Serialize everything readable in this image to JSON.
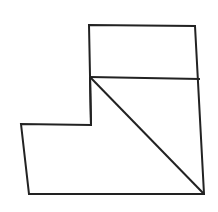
{
  "diagram": {
    "stroke_color": "#222222",
    "background": "#ffffff",
    "outline": "89,25 195,26 204,194 29,194 21,124 91,125",
    "segments": [
      {
        "name": "horizontal-divider",
        "x1": 90,
        "y1": 77,
        "x2": 200,
        "y2": 79
      },
      {
        "name": "diagonal",
        "x1": 90,
        "y1": 77,
        "x2": 204,
        "y2": 194
      },
      {
        "name": "inner-vertical",
        "x1": 90,
        "y1": 77,
        "x2": 91,
        "y2": 125
      }
    ]
  }
}
